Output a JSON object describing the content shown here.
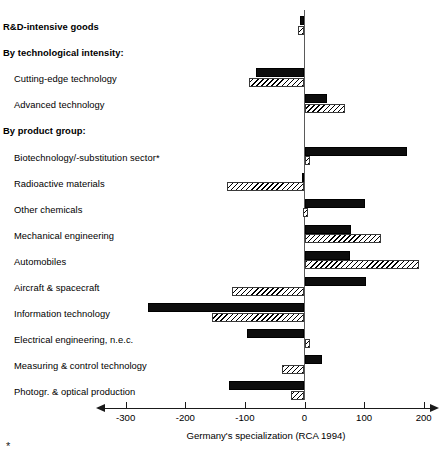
{
  "chart_data": {
    "type": "bar",
    "orientation": "horizontal",
    "title": "",
    "xlabel": "Germany's specialization (RCA 1994)",
    "ylabel": "",
    "xlim": [
      -350,
      230
    ],
    "xticks": [
      -300,
      -200,
      -100,
      0,
      100,
      200
    ],
    "xticklabels": [
      "-300",
      "-200",
      "-100",
      "0",
      "100",
      "200"
    ],
    "grid": false,
    "legend": "none",
    "zero_reference_line": true,
    "rows": [
      {
        "label": "R&D-intensive goods",
        "style": "header",
        "solid": -8,
        "hatch": -11
      },
      {
        "label": "By technological intensity:",
        "style": "header",
        "solid": null,
        "hatch": null
      },
      {
        "label": "Cutting-edge technology",
        "style": "indent",
        "solid": -82,
        "hatch": -93
      },
      {
        "label": "Advanced technology",
        "style": "indent",
        "solid": 38,
        "hatch": 68
      },
      {
        "label": "By product group:",
        "style": "header",
        "solid": null,
        "hatch": null
      },
      {
        "label": "Biotechnology/-substitution sector*",
        "style": "indent",
        "solid": 172,
        "hatch": 9
      },
      {
        "label": "Radioactive materials",
        "style": "indent",
        "solid": -4,
        "hatch": -130
      },
      {
        "label": "Other chemicals",
        "style": "indent",
        "solid": 102,
        "hatch": -3
      },
      {
        "label": "Mechanical engineering",
        "style": "indent",
        "solid": 78,
        "hatch": 128
      },
      {
        "label": "Automobiles",
        "style": "indent",
        "solid": 77,
        "hatch": 192
      },
      {
        "label": "Aircraft & spacecraft",
        "style": "indent",
        "solid": 103,
        "hatch": -122
      },
      {
        "label": "Information technology",
        "style": "indent",
        "solid": -262,
        "hatch": -155
      },
      {
        "label": "Electrical engineering, n.e.c.",
        "style": "indent",
        "solid": -97,
        "hatch": 8
      },
      {
        "label": "Measuring & control technology",
        "style": "indent",
        "solid": 30,
        "hatch": -37
      },
      {
        "label": "Photogr. & optical production",
        "style": "indent",
        "solid": -127,
        "hatch": -22
      }
    ],
    "series": [
      {
        "name": "solid",
        "fill": "solid-black",
        "values": [
          -8,
          null,
          -82,
          38,
          null,
          172,
          -4,
          102,
          78,
          77,
          103,
          -262,
          -97,
          30,
          -127
        ]
      },
      {
        "name": "hatched",
        "fill": "diagonal-hatch",
        "values": [
          -11,
          null,
          -93,
          68,
          null,
          9,
          -130,
          -3,
          128,
          192,
          -122,
          -155,
          8,
          -37,
          -22
        ]
      }
    ]
  },
  "footnote": {
    "marker": "*"
  },
  "colors": {
    "solid_bar": "#0d0d0d",
    "hatch_line": "#000000",
    "axis": "#1a1a1a",
    "zero_line": "#5a5a5a",
    "background": "#ffffff"
  }
}
